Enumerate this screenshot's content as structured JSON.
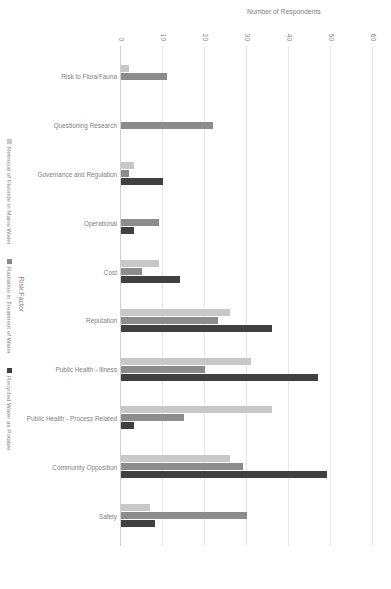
{
  "chart_data": {
    "type": "bar",
    "title": "",
    "xlabel": "Risk Factor",
    "ylabel": "Number of Respondents",
    "ylim": [
      0,
      60
    ],
    "yticks": [
      "0",
      "10",
      "20",
      "30",
      "40",
      "50",
      "60"
    ],
    "grid": true,
    "legend_position": "bottom",
    "categories": [
      "Risk to Flora/Fauna",
      "Questioning Research",
      "Governance and Regulation",
      "Operational",
      "Cost",
      "Reputation",
      "Public Health - Illness",
      "Public Health - Process Related",
      "Community Opposition",
      "Safety"
    ],
    "series": [
      {
        "name": "Removal of Fluoride in Mains Water",
        "color": "#c8c8c8",
        "values": [
          2,
          0,
          3,
          0,
          9,
          26,
          31,
          36,
          26,
          7
        ]
      },
      {
        "name": "Radiation in Treatment of Water",
        "color": "#8c8c8c",
        "values": [
          11,
          22,
          2,
          9,
          5,
          23,
          20,
          15,
          29,
          30
        ]
      },
      {
        "name": "Recycled Water as Potable",
        "color": "#404040",
        "values": [
          0,
          0,
          10,
          3,
          14,
          36,
          47,
          3,
          49,
          8
        ]
      }
    ]
  },
  "colors": {
    "grid": "#e6e6e6",
    "axis": "#d0d0d0",
    "text": "#808080",
    "background": "#ffffff"
  }
}
